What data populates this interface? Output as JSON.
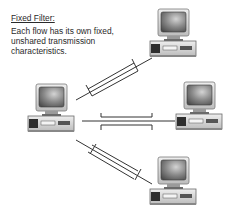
{
  "caption": {
    "title": "Fixed Filter:",
    "body": "Each flow has its own fixed, unshared transmission characteristics."
  },
  "nodes": [
    {
      "id": "left-computer",
      "icon": "desktop-computer-icon",
      "x": 28,
      "y": 84
    },
    {
      "id": "top-computer",
      "icon": "desktop-computer-icon",
      "x": 150,
      "y": 9
    },
    {
      "id": "right-computer",
      "icon": "desktop-computer-icon",
      "x": 176,
      "y": 82
    },
    {
      "id": "bottom-computer",
      "icon": "desktop-computer-icon",
      "x": 150,
      "y": 157
    }
  ],
  "flows": [
    {
      "from": "left-computer",
      "to": "top-computer",
      "label": "fixed-flow-upper"
    },
    {
      "from": "left-computer",
      "to": "right-computer",
      "label": "fixed-flow-middle"
    },
    {
      "from": "left-computer",
      "to": "bottom-computer",
      "label": "fixed-flow-lower"
    }
  ],
  "colors": {
    "line": "#333333",
    "monitor_body": "#d8d8d8",
    "screen": "#6a6a6a",
    "text": "#2a2a2a"
  }
}
